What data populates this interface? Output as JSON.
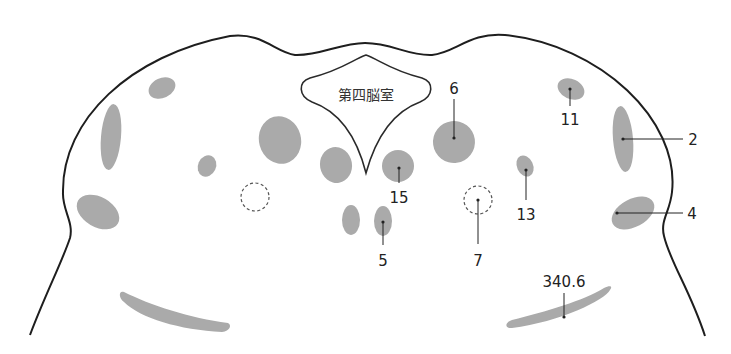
{
  "diagram": {
    "type": "anatomical cross-section (brainstem / pons)",
    "ventricle_label": "第四脳室",
    "colors": {
      "outline": "#1e1e1e",
      "region_fill": "#aaaaaa",
      "leader": "#222222",
      "dashed": "#555555"
    },
    "labels": [
      {
        "id": "6",
        "text": "6"
      },
      {
        "id": "11",
        "text": "11"
      },
      {
        "id": "2",
        "text": "2"
      },
      {
        "id": "15",
        "text": "15"
      },
      {
        "id": "13",
        "text": "13"
      },
      {
        "id": "4",
        "text": "4"
      },
      {
        "id": "5",
        "text": "5"
      },
      {
        "id": "7",
        "text": "7"
      },
      {
        "id": "340.6",
        "text": "340.6"
      }
    ]
  }
}
